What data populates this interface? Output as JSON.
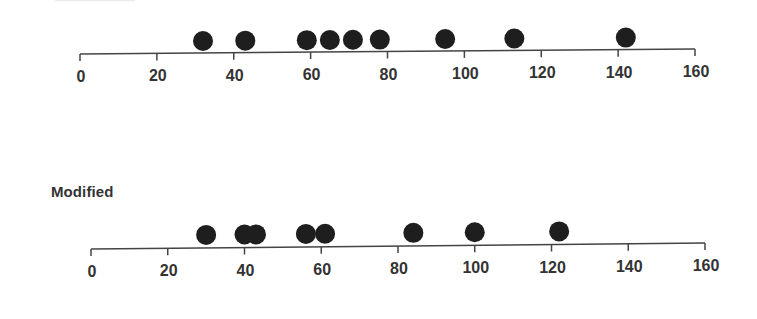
{
  "chart_data": [
    {
      "type": "scatter",
      "subtype": "dot-strip",
      "title": "",
      "xlabel": "",
      "ylabel": "",
      "xlim": [
        0,
        160
      ],
      "x_ticks": [
        0,
        20,
        40,
        60,
        80,
        100,
        120,
        140,
        160
      ],
      "tick_labels": [
        "0",
        "20",
        "40",
        "60",
        "80",
        "100",
        "120",
        "140",
        "160"
      ],
      "grid": false,
      "values": [
        32,
        43,
        59,
        65,
        71,
        78,
        95,
        113,
        142
      ]
    },
    {
      "type": "scatter",
      "subtype": "dot-strip",
      "title": "Modified",
      "xlabel": "",
      "ylabel": "",
      "xlim": [
        0,
        160
      ],
      "x_ticks": [
        0,
        20,
        40,
        60,
        80,
        100,
        120,
        140,
        160
      ],
      "tick_labels": [
        "0",
        "20",
        "40",
        "60",
        "80",
        "100",
        "120",
        "140",
        "160"
      ],
      "grid": false,
      "values": [
        30,
        40,
        43,
        56,
        61,
        84,
        100,
        122
      ]
    }
  ],
  "colors": {
    "dot": "#1e1e1e",
    "axis": "#444444",
    "text": "#333333"
  },
  "panels": {
    "bottom": {
      "title": "Modified"
    }
  }
}
